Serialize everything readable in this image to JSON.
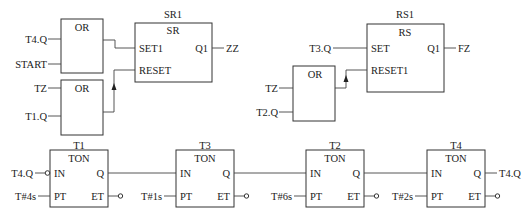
{
  "diagram": {
    "type": "function-block-diagram",
    "or_blocks": [
      {
        "id": "or1",
        "label": "OR",
        "inputs": [
          "T4.Q",
          "START"
        ]
      },
      {
        "id": "or2",
        "label": "OR",
        "inputs": [
          "TZ",
          "T1.Q"
        ]
      },
      {
        "id": "or3",
        "label": "OR",
        "inputs": [
          "TZ",
          "T2.Q"
        ]
      }
    ],
    "sr1": {
      "instance": "SR1",
      "type": "SR",
      "set_pin": "SET1",
      "reset_pin": "RESET",
      "out_pin": "Q1",
      "out_var": "ZZ"
    },
    "rs1": {
      "instance": "RS1",
      "type": "RS",
      "set_pin": "SET",
      "reset_pin": "RESET1",
      "out_pin": "Q1",
      "out_var": "FZ",
      "set_var": "T3.Q"
    },
    "timers": [
      {
        "instance": "T1",
        "type": "TON",
        "in_pin": "IN",
        "pt_pin": "PT",
        "q_pin": "Q",
        "et_pin": "ET",
        "in_var": "T4.Q",
        "in_negated": true,
        "pt_value": "T#4s"
      },
      {
        "instance": "T3",
        "type": "TON",
        "in_pin": "IN",
        "pt_pin": "PT",
        "q_pin": "Q",
        "et_pin": "ET",
        "pt_value": "T#1s"
      },
      {
        "instance": "T2",
        "type": "TON",
        "in_pin": "IN",
        "pt_pin": "PT",
        "q_pin": "Q",
        "et_pin": "ET",
        "pt_value": "T#6s"
      },
      {
        "instance": "T4",
        "type": "TON",
        "in_pin": "IN",
        "pt_pin": "PT",
        "q_pin": "Q",
        "et_pin": "ET",
        "pt_value": "T#2s",
        "q_var": "T4.Q"
      }
    ]
  }
}
